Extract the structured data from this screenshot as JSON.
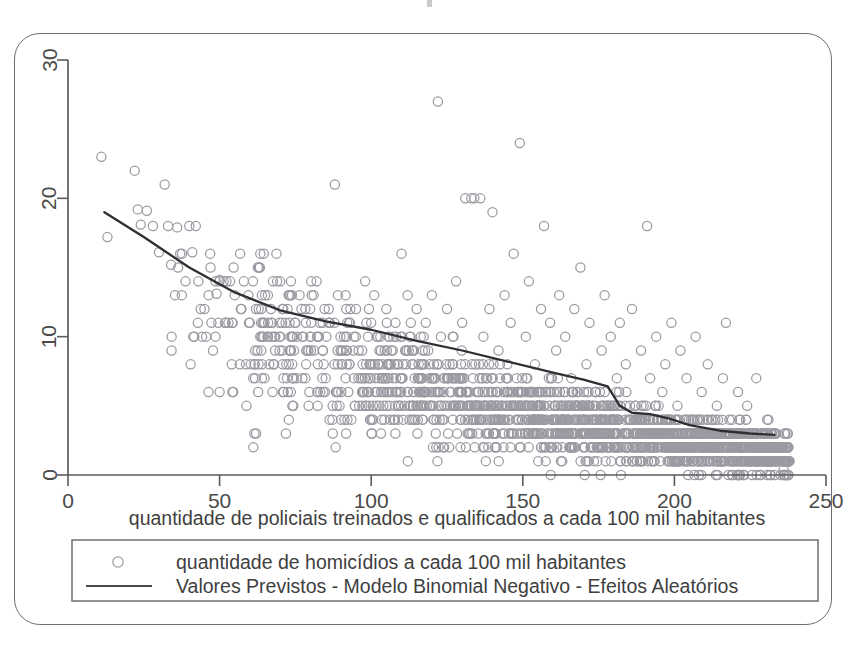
{
  "figure": {
    "frame_color": "#6f6f72",
    "background": "#ffffff"
  },
  "chart_data": {
    "type": "scatter",
    "title": "",
    "subtitle": "",
    "xlabel": "quantidade de policiais treinados e qualificados a cada 100 mil habitantes",
    "ylabel": "",
    "xlim": [
      0,
      250
    ],
    "ylim": [
      0,
      30
    ],
    "xticks": [
      0,
      50,
      100,
      150,
      200,
      250
    ],
    "yticks": [
      0,
      10,
      20,
      30
    ],
    "xtick_labels": [
      "0",
      "50",
      "100",
      "150",
      "200",
      "250"
    ],
    "ytick_labels": [
      "0",
      "10",
      "20",
      "30"
    ],
    "grid": false,
    "legend_position": "below-axes",
    "legend": [
      {
        "marker": "open-circle",
        "label": "quantidade de homicídios a cada 100 mil habitantes"
      },
      {
        "marker": "line",
        "label": "Valores Previstos - Modelo Binomial Negativo - Efeitos Aleatórios"
      }
    ],
    "series": [
      {
        "name": "quantidade de homicídios a cada 100 mil habitantes",
        "type": "scatter",
        "marker": "open-circle",
        "marker_color": "#9a9aa2",
        "points": [
          [
            11,
            23
          ],
          [
            13,
            17.2
          ],
          [
            22,
            22
          ],
          [
            23,
            19.2
          ],
          [
            24,
            18.1
          ],
          [
            26,
            19.1
          ],
          [
            28,
            18
          ],
          [
            30,
            16.1
          ],
          [
            33,
            18
          ],
          [
            36,
            17.9
          ],
          [
            37,
            16
          ],
          [
            34,
            15.2
          ],
          [
            40,
            18
          ],
          [
            41,
            16.1
          ],
          [
            43,
            14
          ],
          [
            45,
            12
          ],
          [
            47,
            15
          ],
          [
            49,
            13.1
          ],
          [
            50,
            14.1
          ],
          [
            52,
            11
          ],
          [
            54,
            8
          ],
          [
            55,
            13
          ],
          [
            57,
            12
          ],
          [
            58,
            14
          ],
          [
            60,
            11
          ],
          [
            62,
            12
          ],
          [
            63,
            15
          ],
          [
            65,
            13
          ],
          [
            66,
            11
          ],
          [
            68,
            10
          ],
          [
            70,
            14
          ],
          [
            71,
            12
          ],
          [
            73,
            13
          ],
          [
            75,
            11
          ],
          [
            77,
            12
          ],
          [
            79,
            9
          ],
          [
            80,
            10
          ],
          [
            82,
            14
          ],
          [
            84,
            11
          ],
          [
            85,
            7
          ],
          [
            86,
            12
          ],
          [
            88,
            21
          ],
          [
            89,
            13
          ],
          [
            91,
            10
          ],
          [
            93,
            11
          ],
          [
            95,
            12
          ],
          [
            97,
            9
          ],
          [
            98,
            14
          ],
          [
            100,
            11
          ],
          [
            101,
            13
          ],
          [
            103,
            10
          ],
          [
            105,
            12
          ],
          [
            106,
            8
          ],
          [
            108,
            11
          ],
          [
            110,
            16
          ],
          [
            112,
            13
          ],
          [
            113,
            10
          ],
          [
            115,
            12
          ],
          [
            117,
            9
          ],
          [
            118,
            11
          ],
          [
            120,
            13
          ],
          [
            122,
            27
          ],
          [
            123,
            10
          ],
          [
            125,
            12
          ],
          [
            127,
            8
          ],
          [
            128,
            14
          ],
          [
            130,
            11
          ],
          [
            131,
            20
          ],
          [
            133,
            20
          ],
          [
            134,
            20
          ],
          [
            136,
            20
          ],
          [
            137,
            10
          ],
          [
            139,
            12
          ],
          [
            140,
            19
          ],
          [
            142,
            9
          ],
          [
            144,
            13
          ],
          [
            146,
            11
          ],
          [
            147,
            16
          ],
          [
            149,
            24
          ],
          [
            151,
            10
          ],
          [
            152,
            14
          ],
          [
            154,
            8
          ],
          [
            156,
            12
          ],
          [
            157,
            18
          ],
          [
            159,
            11
          ],
          [
            161,
            9
          ],
          [
            162,
            13
          ],
          [
            164,
            10
          ],
          [
            166,
            7
          ],
          [
            167,
            12
          ],
          [
            169,
            15
          ],
          [
            171,
            8
          ],
          [
            172,
            11
          ],
          [
            174,
            6
          ],
          [
            176,
            9
          ],
          [
            177,
            13
          ],
          [
            179,
            10
          ],
          [
            181,
            7
          ],
          [
            182,
            11
          ],
          [
            184,
            8
          ],
          [
            186,
            12
          ],
          [
            187,
            5
          ],
          [
            189,
            9
          ],
          [
            191,
            18
          ],
          [
            192,
            7
          ],
          [
            194,
            10
          ],
          [
            196,
            6
          ],
          [
            197,
            8
          ],
          [
            199,
            11
          ],
          [
            201,
            5
          ],
          [
            202,
            9
          ],
          [
            204,
            7
          ],
          [
            206,
            4
          ],
          [
            207,
            10
          ],
          [
            209,
            6
          ],
          [
            211,
            8
          ],
          [
            212,
            3
          ],
          [
            214,
            5
          ],
          [
            216,
            7
          ],
          [
            217,
            11
          ],
          [
            219,
            4
          ],
          [
            221,
            6
          ],
          [
            222,
            2
          ],
          [
            224,
            5
          ],
          [
            226,
            3
          ],
          [
            227,
            7
          ],
          [
            229,
            1
          ],
          [
            231,
            4
          ],
          [
            233,
            2
          ],
          [
            235,
            2
          ],
          [
            236,
            0.4
          ]
        ]
      },
      {
        "name": "Valores Previstos - Modelo Binomial Negativo - Efeitos Aleatórios",
        "type": "line",
        "line_color": "#2f2f33",
        "points": [
          [
            12,
            19.0
          ],
          [
            25,
            17.2
          ],
          [
            40,
            15.0
          ],
          [
            55,
            13.2
          ],
          [
            70,
            11.9
          ],
          [
            85,
            11.1
          ],
          [
            100,
            10.5
          ],
          [
            115,
            9.7
          ],
          [
            130,
            9.0
          ],
          [
            145,
            8.2
          ],
          [
            160,
            7.4
          ],
          [
            170,
            6.9
          ],
          [
            178,
            6.4
          ],
          [
            182,
            5.0
          ],
          [
            186,
            4.5
          ],
          [
            192,
            4.4
          ],
          [
            198,
            4.1
          ],
          [
            205,
            3.6
          ],
          [
            215,
            3.2
          ],
          [
            225,
            3.0
          ],
          [
            233,
            2.9
          ]
        ]
      }
    ]
  }
}
